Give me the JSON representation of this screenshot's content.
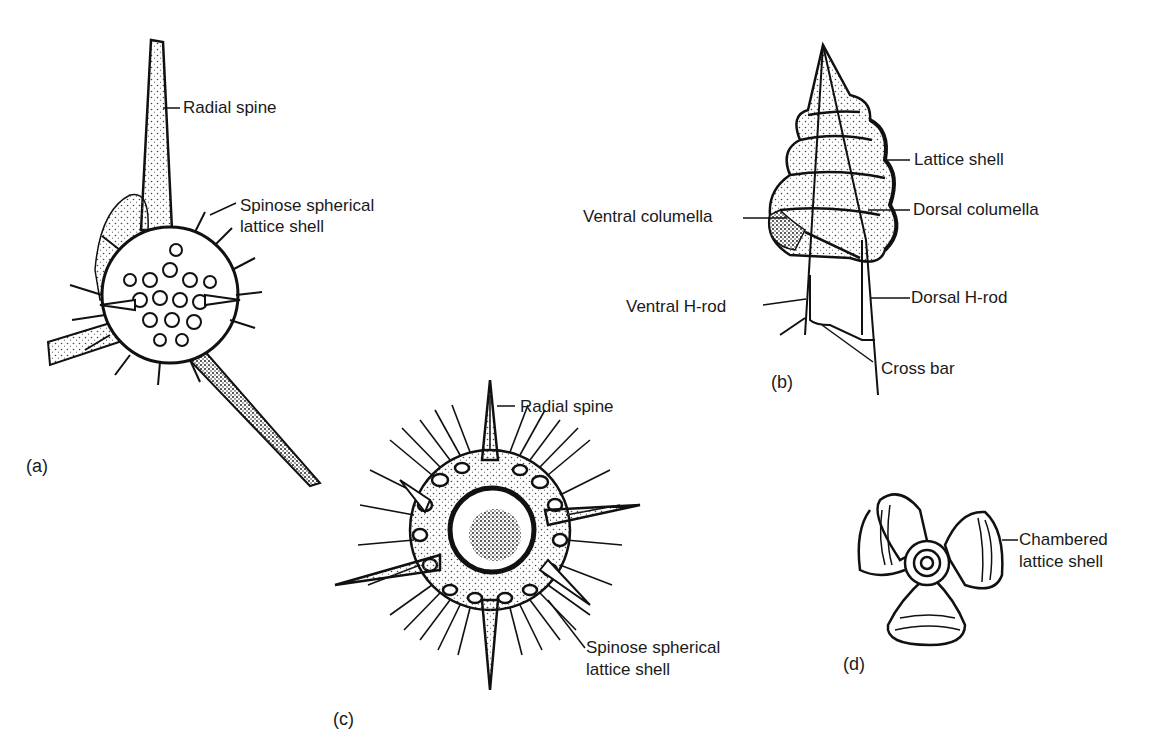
{
  "figure": {
    "panels": [
      {
        "id": "a",
        "label": "(a)",
        "annotations": [
          "Radial spine",
          "Spinose spherical lattice shell"
        ],
        "annotation_lines": {
          "spinose_1": "Spinose spherical",
          "spinose_2": "lattice shell"
        }
      },
      {
        "id": "b",
        "label": "(b)",
        "annotations": [
          "Lattice shell",
          "Ventral columella",
          "Dorsal columella",
          "Ventral H-rod",
          "Dorsal H-rod",
          "Cross bar"
        ]
      },
      {
        "id": "c",
        "label": "(c)",
        "annotations": [
          "Radial spine",
          "Spinose spherical lattice shell"
        ],
        "annotation_lines": {
          "spinose_1": "Spinose spherical",
          "spinose_2": "lattice shell"
        }
      },
      {
        "id": "d",
        "label": "(d)",
        "annotations": [
          "Chambered lattice shell"
        ],
        "annotation_lines": {
          "line_1": "Chambered",
          "line_2": "lattice shell"
        }
      }
    ],
    "colors": {
      "ink": "#1a1a1a",
      "background": "#ffffff",
      "stipple": "#555555"
    }
  }
}
